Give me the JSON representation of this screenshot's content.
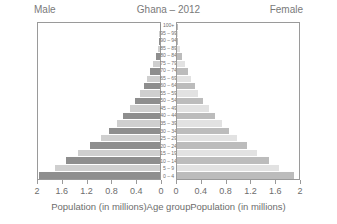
{
  "header": {
    "left_label": "Male",
    "title": "Ghana – 2012",
    "right_label": "Female"
  },
  "captions": {
    "male": "Population (in millions)",
    "center": "Age group",
    "female": "Population (in millions)"
  },
  "axis": {
    "male_ticks": [
      "2",
      "1.6",
      "1.2",
      "0.8",
      "0.4",
      "0"
    ],
    "female_ticks": [
      "0",
      "0.4",
      "0.8",
      "1.2",
      "1.6",
      "2"
    ],
    "max": 2,
    "tick_step": 0.4
  },
  "colors": {
    "male_dark": "#8e8e8e",
    "male_light": "#cfcfcf",
    "female_dark": "#bcbcbc",
    "female_light": "#e2e2e2",
    "frame": "#9a9a9a",
    "text": "#6d6d6d",
    "background": "#ffffff"
  },
  "chart_data": {
    "type": "bar",
    "title": "Ghana – 2012",
    "subtitle": "",
    "xlabel": "Population (in millions)",
    "ylabel": "Age group",
    "xlim": [
      0,
      2
    ],
    "grid": false,
    "legend": "none",
    "orientation": "population-pyramid",
    "categories": [
      "0 – 4",
      "5 – 9",
      "10 – 14",
      "15 – 19",
      "20 – 24",
      "25 – 29",
      "30 – 34",
      "35 – 39",
      "40 – 44",
      "45 – 49",
      "50 – 54",
      "55 – 59",
      "60 – 64",
      "65 – 69",
      "70 – 74",
      "75 – 79",
      "80 – 84",
      "85 – 89",
      "90 – 94",
      "95 – 99",
      "100+"
    ],
    "series": [
      {
        "name": "Male",
        "side": "left",
        "values": [
          1.98,
          1.72,
          1.54,
          1.34,
          1.15,
          0.97,
          0.84,
          0.71,
          0.6,
          0.5,
          0.41,
          0.33,
          0.27,
          0.21,
          0.16,
          0.11,
          0.07,
          0.04,
          0.02,
          0.01,
          0.004
        ]
      },
      {
        "name": "Female",
        "side": "right",
        "values": [
          1.92,
          1.68,
          1.5,
          1.31,
          1.14,
          0.99,
          0.86,
          0.73,
          0.62,
          0.52,
          0.43,
          0.35,
          0.29,
          0.23,
          0.18,
          0.13,
          0.08,
          0.045,
          0.022,
          0.009,
          0.004
        ]
      }
    ]
  }
}
